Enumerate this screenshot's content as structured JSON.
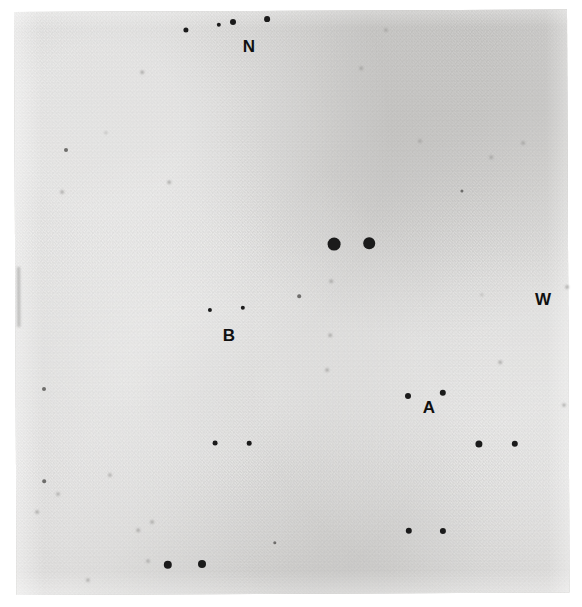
{
  "figure": {
    "kind": "astronomical-photographic-plate",
    "width": 582,
    "height": 607,
    "background_color": "#ffffff",
    "plate_color": "#d4d3d1",
    "star_color": "#1b1b1b",
    "label_color": "#101010"
  },
  "plate": {
    "x": 14,
    "y": 12,
    "width": 553,
    "height": 583,
    "rotation_deg": -0.25
  },
  "labels": [
    {
      "id": "label-n",
      "text": "N",
      "x": 249,
      "y": 46,
      "size": 17
    },
    {
      "id": "label-w",
      "text": "W",
      "x": 543,
      "y": 299,
      "size": 17
    },
    {
      "id": "label-b",
      "text": "B",
      "x": 229,
      "y": 335,
      "size": 17
    },
    {
      "id": "label-a",
      "text": "A",
      "x": 429,
      "y": 407,
      "size": 17
    }
  ],
  "stars": [
    {
      "x": 186,
      "y": 30,
      "r": 2.6,
      "class": "soft"
    },
    {
      "x": 219,
      "y": 25,
      "r": 2.2,
      "class": "soft"
    },
    {
      "x": 233,
      "y": 22,
      "r": 3.0,
      "class": "soft"
    },
    {
      "x": 267,
      "y": 19,
      "r": 2.9,
      "class": "soft"
    },
    {
      "x": 142,
      "y": 72,
      "r": 1.3,
      "class": "vfaint"
    },
    {
      "x": 66,
      "y": 150,
      "r": 2.0,
      "class": "faint"
    },
    {
      "x": 106,
      "y": 133,
      "r": 1.2,
      "class": "vfaint"
    },
    {
      "x": 169,
      "y": 182,
      "r": 1.3,
      "class": "vfaint"
    },
    {
      "x": 62,
      "y": 192,
      "r": 1.4,
      "class": "vfaint"
    },
    {
      "x": 386,
      "y": 30,
      "r": 1.6,
      "class": "vfaint"
    },
    {
      "x": 361,
      "y": 68,
      "r": 1.3,
      "class": "vfaint"
    },
    {
      "x": 420,
      "y": 141,
      "r": 1.6,
      "class": "vfaint"
    },
    {
      "x": 462,
      "y": 191,
      "r": 1.6,
      "class": "faint"
    },
    {
      "x": 491,
      "y": 157,
      "r": 1.3,
      "class": "vfaint"
    },
    {
      "x": 523,
      "y": 143,
      "r": 1.4,
      "class": "vfaint"
    },
    {
      "x": 334,
      "y": 244,
      "r": 6.4,
      "class": "soft"
    },
    {
      "x": 369,
      "y": 243,
      "r": 5.8,
      "class": "soft"
    },
    {
      "x": 299,
      "y": 296,
      "r": 1.8,
      "class": "faint"
    },
    {
      "x": 331,
      "y": 281,
      "r": 1.3,
      "class": "vfaint"
    },
    {
      "x": 210,
      "y": 310,
      "r": 2.1,
      "class": "soft"
    },
    {
      "x": 243,
      "y": 308,
      "r": 2.2,
      "class": "soft"
    },
    {
      "x": 226,
      "y": 338,
      "r": 1.1,
      "class": "vfaint"
    },
    {
      "x": 330,
      "y": 335,
      "r": 1.3,
      "class": "vfaint"
    },
    {
      "x": 482,
      "y": 295,
      "r": 1.2,
      "class": "vfaint"
    },
    {
      "x": 567,
      "y": 287,
      "r": 1.4,
      "class": "vfaint"
    },
    {
      "x": 44,
      "y": 389,
      "r": 2.0,
      "class": "faint"
    },
    {
      "x": 215,
      "y": 443,
      "r": 2.4,
      "class": "soft"
    },
    {
      "x": 249,
      "y": 443,
      "r": 2.3,
      "class": "soft"
    },
    {
      "x": 110,
      "y": 475,
      "r": 1.6,
      "class": "vfaint"
    },
    {
      "x": 44,
      "y": 481,
      "r": 1.8,
      "class": "faint"
    },
    {
      "x": 58,
      "y": 494,
      "r": 1.5,
      "class": "vfaint"
    },
    {
      "x": 37,
      "y": 512,
      "r": 1.4,
      "class": "vfaint"
    },
    {
      "x": 152,
      "y": 522,
      "r": 1.4,
      "class": "vfaint"
    },
    {
      "x": 138,
      "y": 530,
      "r": 1.3,
      "class": "vfaint"
    },
    {
      "x": 408,
      "y": 396,
      "r": 3.0,
      "class": "soft"
    },
    {
      "x": 443,
      "y": 393,
      "r": 3.2,
      "class": "soft"
    },
    {
      "x": 479,
      "y": 444,
      "r": 3.6,
      "class": "soft"
    },
    {
      "x": 515,
      "y": 444,
      "r": 3.2,
      "class": "soft"
    },
    {
      "x": 409,
      "y": 531,
      "r": 3.2,
      "class": "soft"
    },
    {
      "x": 443,
      "y": 531,
      "r": 3.1,
      "class": "soft"
    },
    {
      "x": 327,
      "y": 370,
      "r": 1.4,
      "class": "vfaint"
    },
    {
      "x": 500,
      "y": 362,
      "r": 1.3,
      "class": "vfaint"
    },
    {
      "x": 564,
      "y": 405,
      "r": 1.5,
      "class": "vfaint"
    },
    {
      "x": 275,
      "y": 543,
      "r": 1.7,
      "class": "faint"
    },
    {
      "x": 148,
      "y": 561,
      "r": 1.5,
      "class": "vfaint"
    },
    {
      "x": 168,
      "y": 565,
      "r": 4.2,
      "class": "soft"
    },
    {
      "x": 202,
      "y": 564,
      "r": 4.0,
      "class": "soft"
    },
    {
      "x": 88,
      "y": 580,
      "r": 1.6,
      "class": "vfaint"
    }
  ]
}
